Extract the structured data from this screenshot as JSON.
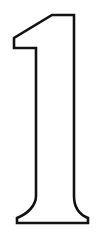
{
  "artwork": {
    "title": "Numeral One Outline",
    "character": "1",
    "style": "line-art outline, unfilled",
    "canvas": {
      "width": 100,
      "height": 238,
      "background_color": "#ffffff"
    },
    "stroke": {
      "color": "#121212",
      "width": 2.6,
      "join": "miter",
      "cap": "butt"
    },
    "fill_color": "#ffffff",
    "outline_path": "M 52.0 15.0 L 74.0 15.0 L 74.0 196.0 C 74.0 206.0 78.0 214.0 88.0 218.0 L 88.0 223.0 L 17.0 223.0 L 17.0 218.0 C 27.0 214.0 36.0 206.0 36.0 196.0 L 36.0 48.0 L 14.0 48.0 L 14.0 38.0 Z",
    "vertices": [
      {
        "name": "flag-tip-top",
        "x": 52,
        "y": 15
      },
      {
        "name": "top-right-corner",
        "x": 74,
        "y": 15
      },
      {
        "name": "stem-right-edge-bottom",
        "x": 74,
        "y": 196
      },
      {
        "name": "foot-right-outer",
        "x": 88,
        "y": 218
      },
      {
        "name": "baseline-right",
        "x": 88,
        "y": 223
      },
      {
        "name": "baseline-left",
        "x": 17,
        "y": 223
      },
      {
        "name": "foot-left-outer",
        "x": 17,
        "y": 218
      },
      {
        "name": "stem-left-edge-bottom",
        "x": 36,
        "y": 196
      },
      {
        "name": "shelf-inner-corner",
        "x": 36,
        "y": 48
      },
      {
        "name": "shelf-left-end",
        "x": 14,
        "y": 48
      },
      {
        "name": "flag-back-corner",
        "x": 14,
        "y": 38
      }
    ],
    "segments": [
      {
        "name": "top-horizontal",
        "kind": "line",
        "from": "flag-tip-top",
        "to": "top-right-corner"
      },
      {
        "name": "stem-right-vertical",
        "kind": "line",
        "from": "top-right-corner",
        "to": "stem-right-edge-bottom"
      },
      {
        "name": "foot-right-flare",
        "kind": "curve",
        "from": "stem-right-edge-bottom",
        "to": "foot-right-outer"
      },
      {
        "name": "foot-right-edge",
        "kind": "line",
        "from": "foot-right-outer",
        "to": "baseline-right"
      },
      {
        "name": "baseline",
        "kind": "line",
        "from": "baseline-right",
        "to": "baseline-left"
      },
      {
        "name": "foot-left-edge",
        "kind": "line",
        "from": "baseline-left",
        "to": "foot-left-outer"
      },
      {
        "name": "foot-left-flare",
        "kind": "curve",
        "from": "foot-left-outer",
        "to": "stem-left-edge-bottom"
      },
      {
        "name": "stem-left-vertical",
        "kind": "line",
        "from": "stem-left-edge-bottom",
        "to": "shelf-inner-corner"
      },
      {
        "name": "flag-shelf",
        "kind": "line",
        "from": "shelf-inner-corner",
        "to": "shelf-left-end"
      },
      {
        "name": "flag-back-edge",
        "kind": "line",
        "from": "shelf-left-end",
        "to": "flag-back-corner"
      },
      {
        "name": "flag-diagonal",
        "kind": "line",
        "from": "flag-back-corner",
        "to": "flag-tip-top"
      }
    ]
  }
}
